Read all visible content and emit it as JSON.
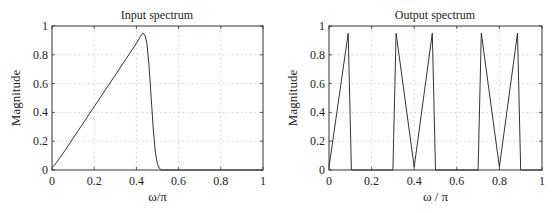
{
  "chart_data": [
    {
      "type": "line",
      "title": "Input spectrum",
      "xlabel": "ω/π",
      "ylabel": "Magnitude",
      "xlim": [
        0,
        1
      ],
      "ylim": [
        0,
        1
      ],
      "xticks": [
        "0",
        "0.2",
        "0.4",
        "0.6",
        "0.8",
        "1"
      ],
      "yticks": [
        "0",
        "0.2",
        "0.4",
        "0.6",
        "0.8",
        "1"
      ],
      "grid": true,
      "series": [
        {
          "name": "input",
          "x": [
            0,
            0.01,
            0.02,
            0.05,
            0.1,
            0.2,
            0.3,
            0.4,
            0.42,
            0.43,
            0.44,
            0.45,
            0.46,
            0.47,
            0.48,
            0.49,
            0.5,
            0.51,
            0.52,
            0.6,
            0.8,
            1.0
          ],
          "y": [
            0.02,
            0.03,
            0.05,
            0.11,
            0.22,
            0.44,
            0.66,
            0.88,
            0.93,
            0.95,
            0.94,
            0.88,
            0.72,
            0.5,
            0.28,
            0.12,
            0.04,
            0.01,
            0,
            0,
            0,
            0
          ]
        }
      ]
    },
    {
      "type": "line",
      "title": "Output spectrum",
      "xlabel": "ω / π",
      "ylabel": "Magnitude",
      "xlim": [
        0,
        1
      ],
      "ylim": [
        0,
        1
      ],
      "xticks": [
        "0",
        "0.2",
        "0.4",
        "0.6",
        "0.8",
        "1"
      ],
      "yticks": [
        "0",
        "0.2",
        "0.4",
        "0.6",
        "0.8",
        "1"
      ],
      "grid": true,
      "series": [
        {
          "name": "output",
          "x": [
            0,
            0.09,
            0.105,
            0.3,
            0.315,
            0.4,
            0.485,
            0.5,
            0.7,
            0.715,
            0.8,
            0.885,
            0.9,
            1.0
          ],
          "y": [
            0.02,
            0.95,
            0,
            0,
            0.95,
            0.02,
            0.95,
            0,
            0,
            0.95,
            0.02,
            0.95,
            0,
            0
          ]
        }
      ]
    }
  ]
}
